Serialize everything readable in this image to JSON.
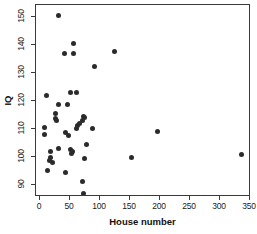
{
  "chart_data": {
    "type": "scatter",
    "title": "",
    "xlabel": "House number",
    "ylabel": "IQ",
    "xlim": [
      0,
      350
    ],
    "ylim": [
      85,
      152
    ],
    "xticks": [
      0,
      50,
      100,
      150,
      200,
      250,
      300,
      350
    ],
    "yticks": [
      90,
      100,
      110,
      120,
      130,
      140,
      150
    ],
    "xtick_labels": [
      "0",
      "50",
      "100",
      "150",
      "200",
      "250",
      "300",
      "350"
    ],
    "ytick_labels": [
      "90",
      "100",
      "110",
      "120",
      "130",
      "140",
      "150"
    ],
    "grid": false,
    "legend": null,
    "marker": {
      "shape": "circle",
      "color": "#2b2b2b",
      "size": 5
    },
    "points": [
      {
        "x": 30,
        "y": 150.7
      },
      {
        "x": 55,
        "y": 140.4
      },
      {
        "x": 40,
        "y": 137.0
      },
      {
        "x": 56,
        "y": 137.0
      },
      {
        "x": 124,
        "y": 137.8
      },
      {
        "x": 90,
        "y": 132.4
      },
      {
        "x": 10,
        "y": 122.0
      },
      {
        "x": 51,
        "y": 123.0
      },
      {
        "x": 60,
        "y": 123.0
      },
      {
        "x": 30,
        "y": 118.8
      },
      {
        "x": 46,
        "y": 118.8
      },
      {
        "x": 26,
        "y": 115.6
      },
      {
        "x": 25,
        "y": 113.8
      },
      {
        "x": 27,
        "y": 113.2
      },
      {
        "x": 72,
        "y": 114.6
      },
      {
        "x": 74,
        "y": 114.0
      },
      {
        "x": 70,
        "y": 113.0
      },
      {
        "x": 66,
        "y": 112.0
      },
      {
        "x": 63,
        "y": 111.4
      },
      {
        "x": 8,
        "y": 110.6
      },
      {
        "x": 61,
        "y": 110.3
      },
      {
        "x": 88,
        "y": 110.2
      },
      {
        "x": 196,
        "y": 109.2
      },
      {
        "x": 7,
        "y": 108.2
      },
      {
        "x": 43,
        "y": 108.6
      },
      {
        "x": 47,
        "y": 107.6
      },
      {
        "x": 78,
        "y": 104.6
      },
      {
        "x": 30,
        "y": 103.0
      },
      {
        "x": 18,
        "y": 102.0
      },
      {
        "x": 51,
        "y": 102.6
      },
      {
        "x": 54,
        "y": 102.0
      },
      {
        "x": 52,
        "y": 101.4
      },
      {
        "x": 336,
        "y": 101.0
      },
      {
        "x": 17,
        "y": 100.0
      },
      {
        "x": 152,
        "y": 99.8
      },
      {
        "x": 74,
        "y": 99.4
      },
      {
        "x": 16,
        "y": 98.6
      },
      {
        "x": 20,
        "y": 98.2
      },
      {
        "x": 12,
        "y": 95.2
      },
      {
        "x": 42,
        "y": 94.3
      },
      {
        "x": 71,
        "y": 91.3
      },
      {
        "x": 73,
        "y": 86.9
      }
    ]
  }
}
